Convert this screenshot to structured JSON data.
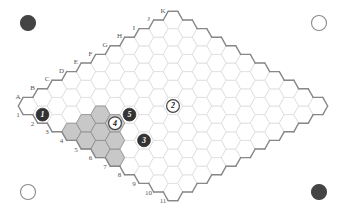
{
  "board": {
    "size": 11,
    "columns": [
      "A",
      "B",
      "C",
      "D",
      "E",
      "F",
      "G",
      "H",
      "I",
      "J",
      "K"
    ],
    "rows": [
      "1",
      "2",
      "3",
      "4",
      "5",
      "6",
      "7",
      "8",
      "9",
      "10",
      "11"
    ]
  },
  "stones": [
    {
      "number": "1",
      "color": "black",
      "cell": "A2"
    },
    {
      "number": "2",
      "color": "white",
      "cell": "F6"
    },
    {
      "number": "3",
      "color": "black",
      "cell": "C7"
    },
    {
      "number": "4",
      "color": "white",
      "cell": "C5"
    },
    {
      "number": "5",
      "color": "black",
      "cell": "D5"
    }
  ],
  "highlighted_cells": [
    "C4",
    "C5",
    "B4",
    "B5",
    "B6",
    "A4",
    "A5",
    "A6",
    "A7"
  ],
  "corner_markers": [
    {
      "position": "top-left",
      "color": "black"
    },
    {
      "position": "top-right",
      "color": "white"
    },
    {
      "position": "bottom-left",
      "color": "white"
    },
    {
      "position": "bottom-right",
      "color": "black"
    }
  ],
  "colors": {
    "background": "#ffffff",
    "grid_line": "#dcdcdc",
    "border_line": "#888888",
    "highlight_fill": "#c8c8c8",
    "highlight_line": "#8a8a8a",
    "black_stone": "#333333",
    "white_stone": "#ffffff",
    "white_stone_outline": "#444444",
    "marker_outline": "#8a8a8a"
  }
}
